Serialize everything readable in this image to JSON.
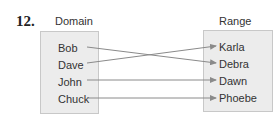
{
  "problem_number": "12.",
  "domain": {
    "title": "Domain",
    "items": [
      "Bob",
      "Dave",
      "John",
      "Chuck"
    ]
  },
  "range": {
    "title": "Range",
    "items": [
      "Karla",
      "Debra",
      "Dawn",
      "Phoebe"
    ]
  },
  "mappings": [
    {
      "from": "Bob",
      "to": "Debra"
    },
    {
      "from": "Dave",
      "to": "Karla"
    },
    {
      "from": "John",
      "to": "Dawn"
    },
    {
      "from": "Chuck",
      "to": "Phoebe"
    }
  ],
  "colors": {
    "box_fill": "#ececec",
    "arrow": "#8a8a8a"
  }
}
